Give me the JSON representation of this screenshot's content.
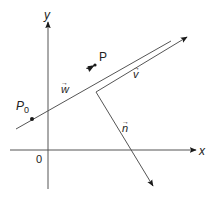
{
  "diagram": {
    "colors": {
      "line": "#555555",
      "arrow": "#1a1a1a",
      "text": "#222222",
      "background": "#ffffff"
    },
    "axes": {
      "x_label": "x",
      "y_label": "y",
      "origin_label": "0"
    },
    "points": {
      "p0_label": "P",
      "p0_subscript": "0",
      "p_label": "P"
    },
    "vectors": {
      "w_label": "w",
      "v_label": "v",
      "n_label": "n",
      "arrow_symbol": "→"
    }
  }
}
